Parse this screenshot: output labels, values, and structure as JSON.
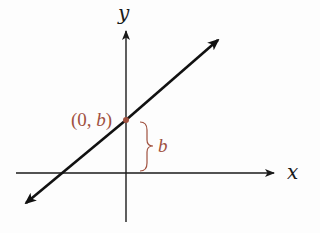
{
  "diagram": {
    "title": "",
    "axes": {
      "x_label": "x",
      "y_label": "y"
    },
    "line": {
      "description": "line with positive slope crossing y-axis at (0, b)",
      "direction": "both-arrows"
    },
    "intercept": {
      "label_open": "(0, ",
      "label_var": "b",
      "label_close": ")",
      "brace_label": "b"
    },
    "colors": {
      "axes": "#1a1a1a",
      "line": "#111111",
      "accent": "#a0513f"
    }
  }
}
